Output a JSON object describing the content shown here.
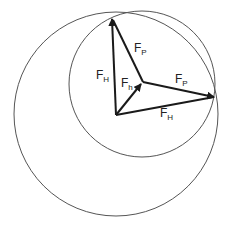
{
  "diagram": {
    "colors": {
      "stroke": "#1a1a1a",
      "circle": "#555555",
      "background": "#ffffff"
    },
    "circles": [
      {
        "name": "large-circle",
        "cx": 116,
        "cy": 114,
        "r": 102
      },
      {
        "name": "small-circle",
        "cx": 142,
        "cy": 84,
        "r": 73
      }
    ],
    "points": {
      "origin": [
        116,
        115
      ],
      "junction": [
        143,
        82
      ],
      "top_vertex": [
        112,
        17
      ],
      "right_vertex": [
        216,
        97
      ]
    },
    "vectors": [
      {
        "name": "F_H-up",
        "from": "origin",
        "to": "top_vertex",
        "arrow": true
      },
      {
        "name": "F_H-right",
        "from": "origin",
        "to": "right_vertex",
        "arrow": false
      },
      {
        "name": "F_h",
        "from": "origin",
        "to": "junction",
        "arrow": true
      },
      {
        "name": "F_P-up",
        "from": "junction",
        "to": "top_vertex",
        "arrow": false
      },
      {
        "name": "F_P-right",
        "from": "junction",
        "to": "right_vertex",
        "arrow": true
      }
    ],
    "labels": {
      "fh_left": {
        "main": "F",
        "sub": "H"
      },
      "fp_top": {
        "main": "F",
        "sub": "P"
      },
      "fh_small": {
        "main": "F",
        "sub": "h"
      },
      "fp_right": {
        "main": "F",
        "sub": "P"
      },
      "fh_bottom": {
        "main": "F",
        "sub": "H"
      }
    }
  }
}
